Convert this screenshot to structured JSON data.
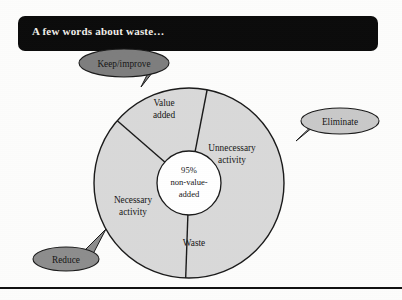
{
  "slide": {
    "title": "A few words about waste…",
    "background_color": "#fdfdfc",
    "title_bar_color": "#0b0b0b",
    "title_text_color": "#f2f0ea",
    "rule_color": "#111111"
  },
  "diagram": {
    "type": "pie-sector-diagram",
    "outer_circle": {
      "fill": "#d9d9d9",
      "stroke": "#1a1a1a",
      "center_x": 189,
      "center_y": 183,
      "radius": 95
    },
    "inner_circle": {
      "fill": "#ffffff",
      "stroke": "#1a1a1a",
      "center_x": 189,
      "center_y": 183,
      "radius": 32
    },
    "center_label_lines": [
      "95%",
      "non-value-",
      "added"
    ],
    "sectors": [
      {
        "name": "value-added",
        "label_lines": [
          "Value",
          "added"
        ],
        "label_x": 164,
        "label_y": 106
      },
      {
        "name": "unnecessary-activity",
        "label_lines": [
          "Unnecessary",
          "activity"
        ],
        "label_x": 232,
        "label_y": 151
      },
      {
        "name": "necessary-activity",
        "label_lines": [
          "Necessary",
          "activity"
        ],
        "label_x": 133,
        "label_y": 203
      },
      {
        "name": "waste",
        "label_lines": [
          "Waste"
        ],
        "label_x": 194,
        "label_y": 246
      }
    ],
    "dividers": [
      {
        "name": "divider-value-unnecessary",
        "angle_deg": 79
      },
      {
        "name": "divider-value-necessary",
        "angle_deg": 139
      },
      {
        "name": "divider-necessary-waste",
        "angle_deg": 268
      }
    ]
  },
  "callouts": [
    {
      "name": "keep-improve",
      "label": "Keep/improve",
      "fill": "#7e7e7e",
      "stroke": "#1a1a1a",
      "cx": 124,
      "cy": 63,
      "rx": 45,
      "ry": 14,
      "text_color": "#0d0d0d"
    },
    {
      "name": "eliminate",
      "label": "Eliminate",
      "fill": "#c9c9c9",
      "stroke": "#1a1a1a",
      "cx": 340,
      "cy": 121,
      "rx": 39,
      "ry": 13,
      "text_color": "#0d0d0d"
    },
    {
      "name": "reduce",
      "label": "Reduce",
      "fill": "#8d8d8d",
      "stroke": "#1a1a1a",
      "cx": 66,
      "cy": 259,
      "rx": 33,
      "ry": 12,
      "text_color": "#0d0d0d"
    }
  ]
}
